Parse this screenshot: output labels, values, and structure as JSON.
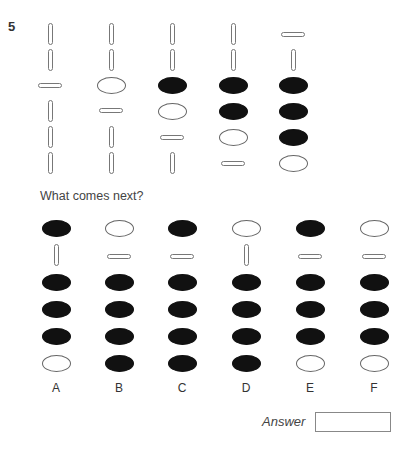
{
  "question": {
    "number": "5",
    "prompt": "What comes next?",
    "answer_label": "Answer",
    "answer_value": ""
  },
  "sequence": [
    {
      "x": 50,
      "items": [
        {
          "type": "vbar",
          "y": 23
        },
        {
          "type": "vbar",
          "y": 49
        },
        {
          "type": "hbar",
          "y": 83
        },
        {
          "type": "vbar",
          "y": 100
        },
        {
          "type": "vbar",
          "y": 126
        },
        {
          "type": "vbar",
          "y": 152
        }
      ]
    },
    {
      "x": 111,
      "items": [
        {
          "type": "vbar",
          "y": 23
        },
        {
          "type": "vbar",
          "y": 49
        },
        {
          "type": "oval-open",
          "y": 77
        },
        {
          "type": "hbar",
          "y": 108
        },
        {
          "type": "vbar",
          "y": 126
        },
        {
          "type": "vbar",
          "y": 152
        }
      ]
    },
    {
      "x": 172,
      "items": [
        {
          "type": "vbar",
          "y": 23
        },
        {
          "type": "vbar",
          "y": 49
        },
        {
          "type": "oval-filled",
          "y": 77
        },
        {
          "type": "oval-open",
          "y": 103
        },
        {
          "type": "hbar",
          "y": 135
        },
        {
          "type": "vbar",
          "y": 152
        }
      ]
    },
    {
      "x": 233,
      "items": [
        {
          "type": "vbar",
          "y": 23
        },
        {
          "type": "vbar",
          "y": 49
        },
        {
          "type": "oval-filled",
          "y": 77
        },
        {
          "type": "oval-filled",
          "y": 103
        },
        {
          "type": "oval-open",
          "y": 129
        },
        {
          "type": "hbar",
          "y": 161
        }
      ]
    },
    {
      "x": 293,
      "items": [
        {
          "type": "hbar",
          "y": 32
        },
        {
          "type": "vbar",
          "y": 49
        },
        {
          "type": "oval-filled",
          "y": 77
        },
        {
          "type": "oval-filled",
          "y": 103
        },
        {
          "type": "oval-filled",
          "y": 129
        },
        {
          "type": "oval-open",
          "y": 155
        }
      ]
    }
  ],
  "options": [
    {
      "label": "A",
      "x": 56,
      "items": [
        {
          "type": "oval-filled",
          "y": 220
        },
        {
          "type": "vbar",
          "y": 244
        },
        {
          "type": "oval-filled",
          "y": 274
        },
        {
          "type": "oval-filled",
          "y": 301
        },
        {
          "type": "oval-filled",
          "y": 328
        },
        {
          "type": "oval-open",
          "y": 355
        }
      ]
    },
    {
      "label": "B",
      "x": 119,
      "items": [
        {
          "type": "oval-open",
          "y": 220
        },
        {
          "type": "hbar",
          "y": 254
        },
        {
          "type": "oval-filled",
          "y": 274
        },
        {
          "type": "oval-filled",
          "y": 301
        },
        {
          "type": "oval-filled",
          "y": 328
        },
        {
          "type": "oval-filled",
          "y": 355
        }
      ]
    },
    {
      "label": "C",
      "x": 182,
      "items": [
        {
          "type": "oval-filled",
          "y": 220
        },
        {
          "type": "hbar",
          "y": 254
        },
        {
          "type": "oval-filled",
          "y": 274
        },
        {
          "type": "oval-filled",
          "y": 301
        },
        {
          "type": "oval-filled",
          "y": 328
        },
        {
          "type": "oval-filled",
          "y": 355
        }
      ]
    },
    {
      "label": "D",
      "x": 246,
      "items": [
        {
          "type": "oval-open",
          "y": 220
        },
        {
          "type": "vbar",
          "y": 244
        },
        {
          "type": "oval-filled",
          "y": 274
        },
        {
          "type": "oval-filled",
          "y": 301
        },
        {
          "type": "oval-filled",
          "y": 328
        },
        {
          "type": "oval-filled",
          "y": 355
        }
      ]
    },
    {
      "label": "E",
      "x": 310,
      "items": [
        {
          "type": "oval-filled",
          "y": 220
        },
        {
          "type": "hbar",
          "y": 254
        },
        {
          "type": "oval-filled",
          "y": 274
        },
        {
          "type": "oval-filled",
          "y": 301
        },
        {
          "type": "oval-filled",
          "y": 328
        },
        {
          "type": "oval-open",
          "y": 355
        }
      ]
    },
    {
      "label": "F",
      "x": 374,
      "items": [
        {
          "type": "oval-open",
          "y": 220
        },
        {
          "type": "hbar",
          "y": 254
        },
        {
          "type": "oval-filled",
          "y": 274
        },
        {
          "type": "oval-filled",
          "y": 301
        },
        {
          "type": "oval-filled",
          "y": 328
        },
        {
          "type": "oval-open",
          "y": 355
        }
      ]
    }
  ],
  "layout": {
    "option_label_y": 381
  }
}
